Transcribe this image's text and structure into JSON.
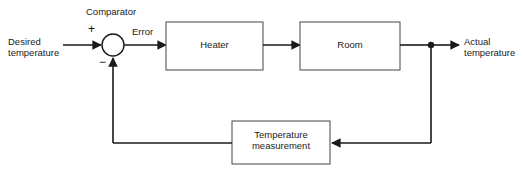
{
  "diagram": {
    "type": "block-diagram",
    "background_color": "#ffffff",
    "line_color": "#1a1a1a",
    "text_color": "#1a1a1a",
    "inputs": [
      {
        "id": "desired",
        "label": "Desired\ntemperature"
      }
    ],
    "outputs": [
      {
        "id": "actual",
        "label": "Actual\ntemperature"
      }
    ],
    "comparator": {
      "caption": "Comparator",
      "plus_sign": "+",
      "minus_sign": "−",
      "output_label": "Error",
      "cx": 113,
      "cy": 45,
      "r": 11
    },
    "blocks": [
      {
        "id": "heater",
        "label": "Heater",
        "x": 166,
        "y": 22,
        "w": 97,
        "h": 48
      },
      {
        "id": "room",
        "label": "Room",
        "x": 300,
        "y": 22,
        "w": 100,
        "h": 48
      },
      {
        "id": "temperature-measurement",
        "label": "Temperature\nmeasurement",
        "x": 232,
        "y": 121,
        "w": 98,
        "h": 43
      }
    ],
    "junction": {
      "id": "output-tap",
      "x": 431,
      "y": 45,
      "r": 3
    },
    "connections": [
      {
        "from": "desired",
        "to": "comparator",
        "direction": "right"
      },
      {
        "from": "comparator",
        "to": "heater",
        "direction": "right",
        "label": "Error"
      },
      {
        "from": "heater",
        "to": "room",
        "direction": "right"
      },
      {
        "from": "room",
        "to": "output-tap",
        "direction": "right"
      },
      {
        "from": "output-tap",
        "to": "actual",
        "direction": "right"
      },
      {
        "from": "output-tap",
        "to": "temperature-measurement",
        "direction": "down-left"
      },
      {
        "from": "temperature-measurement",
        "to": "comparator",
        "direction": "left-up"
      }
    ]
  }
}
